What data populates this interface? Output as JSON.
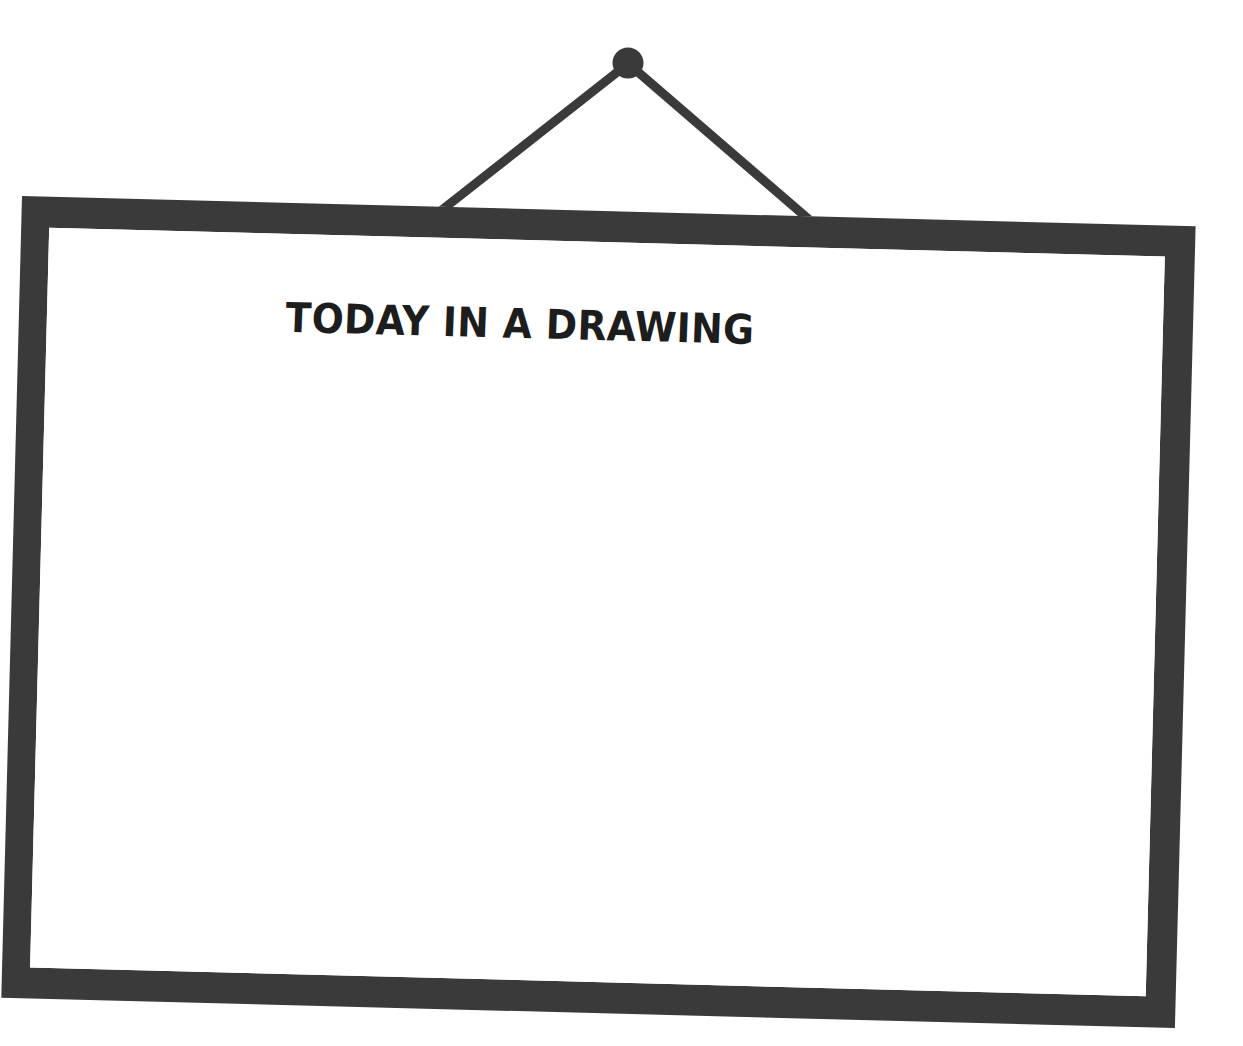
{
  "scene": {
    "background_color": "#ffffff",
    "description": "hanging whiteboard"
  },
  "hardware": {
    "knob": {
      "name": "wall-hook-knob",
      "color": "#3a3a3a",
      "center_x": 628,
      "center_y": 63,
      "radius": 15
    },
    "wires": [
      {
        "name": "hanging-wire-left",
        "color": "#3a3a3a",
        "x1": 625,
        "y1": 66,
        "x2": 438,
        "y2": 212,
        "width": 9
      },
      {
        "name": "hanging-wire-right",
        "color": "#3a3a3a",
        "x1": 631,
        "y1": 66,
        "x2": 813,
        "y2": 222,
        "width": 9
      }
    ]
  },
  "board": {
    "frame_color": "#3a3a3a",
    "surface_color": "#ffffff",
    "frame_thickness": 30,
    "rotation_degrees": 1.48,
    "title": "TODAY IN A DRAWING",
    "body_text": ""
  }
}
